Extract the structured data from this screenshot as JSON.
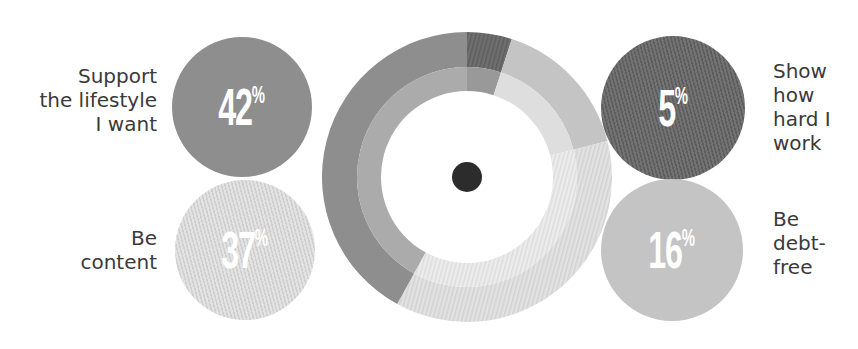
{
  "chart_data": {
    "type": "pie",
    "subtype": "donut-with-bubbles",
    "title": "",
    "categories": [
      "Support the lifestyle I want",
      "Be content",
      "Show how hard I work",
      "Be debt-free"
    ],
    "values": [
      42,
      37,
      5,
      16
    ],
    "unit": "%",
    "colors": {
      "Support the lifestyle I want": "#8e8e8e",
      "Be content": "#dcdcdc",
      "Show how hard I work": "#6f6f6f",
      "Be debt-free": "#c4c4c4"
    },
    "inner_band_colors": {
      "Support the lifestyle I want": "#ababab",
      "Be content": "#e8e8e8",
      "Show how hard I work": "#999999",
      "Be debt-free": "#dedede"
    },
    "center_dot_color": "#2c2c2c",
    "legend_position": "bubbles-left-right"
  },
  "bubbles": [
    {
      "label_lines": [
        "Support",
        "the lifestyle",
        "I want"
      ],
      "value": "42",
      "symbol": "%"
    },
    {
      "label_lines": [
        "Be",
        "content"
      ],
      "value": "37",
      "symbol": "%"
    },
    {
      "label_lines": [
        "Show",
        "how",
        "hard I",
        "work"
      ],
      "value": "5",
      "symbol": "%"
    },
    {
      "label_lines": [
        "Be",
        "debt-",
        "free"
      ],
      "value": "16",
      "symbol": "%"
    }
  ]
}
